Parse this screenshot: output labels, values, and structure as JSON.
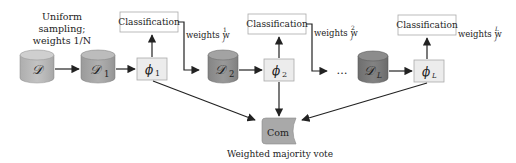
{
  "diagram": {
    "sampling_note": {
      "line1": "Uniform",
      "line2": "sampling;",
      "line3": "weights 1/N"
    },
    "datasets": [
      {
        "id": "D",
        "label": "𝒟",
        "sub": "",
        "color": "#b9b9b9"
      },
      {
        "id": "D1",
        "label": "𝒟",
        "sub": "1",
        "color": "#a6a6a6"
      },
      {
        "id": "D2",
        "label": "𝒟",
        "sub": "2",
        "color": "#8f8f8f"
      },
      {
        "id": "DL",
        "label": "𝒟",
        "sub": "L",
        "color": "#787878"
      }
    ],
    "classifiers": [
      {
        "id": "phi1",
        "label": "ϕ",
        "sub": "1"
      },
      {
        "id": "phi2",
        "label": "ϕ",
        "sub": "2"
      },
      {
        "id": "phiL",
        "label": "ϕ",
        "sub": "L"
      }
    ],
    "classification_boxes": [
      {
        "label": "Classification",
        "weights_label": "weights w",
        "weights_sub": "j",
        "weights_sup": "1"
      },
      {
        "label": "Classification",
        "weights_label": "weights w",
        "weights_sub": "j",
        "weights_sup": "2"
      },
      {
        "label": "Classification",
        "weights_label": "weights w",
        "weights_sub": "j",
        "weights_sup": "L"
      }
    ],
    "ellipsis": "…",
    "combiner": {
      "label": "Com",
      "caption": "Weighted majority vote",
      "color": "#a9a9a9"
    },
    "colors": {
      "box_fill": "#ececec",
      "box_stroke": "#aaaaaa",
      "arrow": "#222222"
    }
  }
}
